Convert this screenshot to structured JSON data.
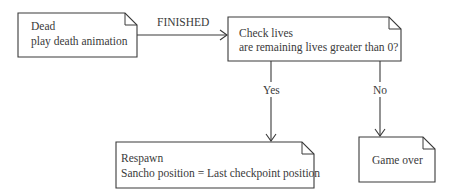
{
  "nodes": {
    "dead": {
      "lines": [
        "Dead",
        "play death animation"
      ]
    },
    "check": {
      "lines": [
        "Check lives",
        "are remaining lives greater than 0?"
      ]
    },
    "respawn": {
      "lines": [
        "Respawn",
        "Sancho position = Last checkpoint position"
      ]
    },
    "gameover": {
      "lines": [
        "Game over"
      ]
    }
  },
  "edges": {
    "finished": {
      "label": "FINISHED"
    },
    "yes": {
      "label": "Yes"
    },
    "no": {
      "label": "No"
    }
  }
}
